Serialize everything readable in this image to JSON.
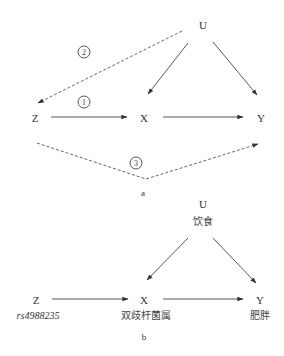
{
  "diagram_a": {
    "caption": "a",
    "nodes": {
      "U": "U",
      "Z": "Z",
      "X": "X",
      "Y": "Y"
    },
    "path_labels": {
      "p1": "1",
      "p2": "2",
      "p3": "3"
    },
    "edges": [
      {
        "from": "U",
        "to": "X",
        "style": "solid"
      },
      {
        "from": "U",
        "to": "Y",
        "style": "solid"
      },
      {
        "from": "Z",
        "to": "X",
        "style": "solid",
        "label": "1"
      },
      {
        "from": "X",
        "to": "Y",
        "style": "solid"
      },
      {
        "from": "U",
        "to": "Z",
        "style": "dashed",
        "label": "2"
      },
      {
        "from": "Z",
        "to": "Y",
        "style": "dashed",
        "label": "3"
      }
    ]
  },
  "diagram_b": {
    "caption": "b",
    "nodes": {
      "U": {
        "symbol": "U",
        "name": "饮食"
      },
      "Z": {
        "symbol": "Z",
        "name": "rs4988235"
      },
      "X": {
        "symbol": "X",
        "name": "双歧杆菌属"
      },
      "Y": {
        "symbol": "Y",
        "name": "肥胖"
      }
    },
    "edges": [
      {
        "from": "U",
        "to": "X",
        "style": "solid"
      },
      {
        "from": "U",
        "to": "Y",
        "style": "solid"
      },
      {
        "from": "Z",
        "to": "X",
        "style": "solid"
      },
      {
        "from": "X",
        "to": "Y",
        "style": "solid"
      }
    ]
  },
  "colors": {
    "line": "#444444",
    "text": "#333333"
  }
}
